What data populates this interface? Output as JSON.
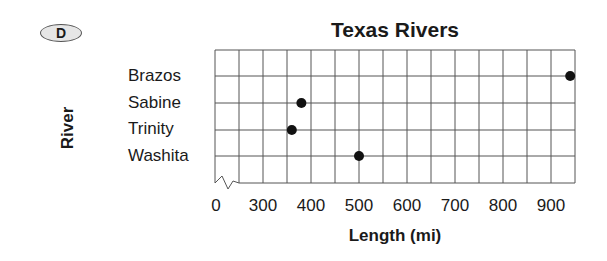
{
  "badge": "D",
  "chart_data": {
    "type": "scatter",
    "title": "Texas Rivers",
    "xlabel": "Length (mi)",
    "ylabel": "River",
    "categories": [
      "Brazos",
      "Sabine",
      "Trinity",
      "Washita"
    ],
    "values": [
      940,
      380,
      360,
      500
    ],
    "x_ticks": [
      "0",
      "300",
      "400",
      "500",
      "600",
      "700",
      "800",
      "900"
    ],
    "xlim": [
      0,
      950
    ],
    "axis_break": "between 0 and 300",
    "grid": true,
    "grid_step": 50
  }
}
